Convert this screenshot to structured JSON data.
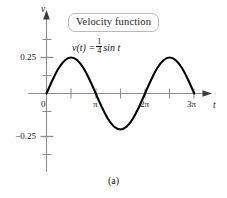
{
  "figure": {
    "caption": "(a)",
    "annotation_box": "Velocity function",
    "equation": {
      "lhs": "v(t) =",
      "frac_num": "1",
      "frac_den": "4",
      "rhs": "sin t"
    }
  },
  "chart_data": {
    "type": "line",
    "title": "Velocity function",
    "annotation": "v(t) = 1/4 sin t",
    "function": "v(t) = 0.25 * sin(t)",
    "xlabel": "t",
    "ylabel": "v",
    "xlim": [
      0,
      9.8696
    ],
    "ylim": [
      -0.5,
      0.5
    ],
    "grid": false,
    "legend": "none",
    "x_tick_labels": [
      "0",
      "π",
      "2π",
      "3π"
    ],
    "x_tick_values": [
      0,
      3.14159,
      6.28319,
      9.42478
    ],
    "x_minor_tick_values": [
      1.5708,
      4.71239,
      7.85398
    ],
    "y_tick_labels": [
      "0.25",
      "−0.25"
    ],
    "y_tick_values": [
      0.25,
      -0.25
    ],
    "y_minor_tick_values": [
      0.125,
      0.375,
      -0.125,
      -0.375
    ],
    "x": [
      0,
      0.3927,
      0.7854,
      1.1781,
      1.5708,
      1.9635,
      2.3562,
      2.7489,
      3.14159,
      3.5343,
      3.927,
      4.3197,
      4.71239,
      5.1051,
      5.4978,
      5.8905,
      6.28319,
      6.6759,
      7.0686,
      7.4613,
      7.85398,
      8.2467,
      8.6394,
      9.0321,
      9.42478
    ],
    "y": [
      0,
      0.0957,
      0.1768,
      0.231,
      0.25,
      0.231,
      0.1768,
      0.0957,
      0,
      -0.0957,
      -0.1768,
      -0.231,
      -0.25,
      -0.231,
      -0.1768,
      -0.0957,
      0,
      0.0957,
      0.1768,
      0.231,
      0.25,
      0.231,
      0.1768,
      0.0957,
      0
    ],
    "series": [
      {
        "name": "v(t) = 1/4 sin t",
        "color": "#000000",
        "maxima": [
          {
            "t": "π/2",
            "v": 0.25
          },
          {
            "t": "5π/2",
            "v": 0.25
          }
        ],
        "minima": [
          {
            "t": "3π/2",
            "v": -0.25
          }
        ],
        "zeros": [
          "0",
          "π",
          "2π",
          "3π"
        ]
      }
    ],
    "colors": {
      "curve": "#000000",
      "axis": "#8d8d8d",
      "text": "#111111",
      "box_border": "#b9b9b9",
      "background": "#ffffff"
    }
  }
}
